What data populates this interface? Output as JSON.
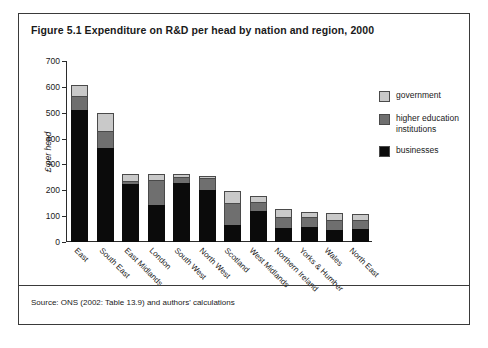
{
  "figure": {
    "title": "Figure 5.1 Expenditure on R&D per head by nation and region, 2000",
    "source": "Source: ONS (2002: Table 13.9) and authors' calculations"
  },
  "legend": {
    "position": "right",
    "items": [
      {
        "label": "government",
        "color": "#c9c9c9",
        "key": "government"
      },
      {
        "label": "higher education institutions",
        "color": "#6f6f6f",
        "key": "higher_education"
      },
      {
        "label": "businesses",
        "color": "#0b0b0b",
        "key": "businesses"
      }
    ]
  },
  "chart_data": {
    "type": "bar",
    "stacked": true,
    "title": "Figure 5.1 Expenditure on R&D per head by nation and region, 2000",
    "xlabel": "",
    "ylabel": "£ per head",
    "ylim": [
      0,
      700
    ],
    "ytick_step": 100,
    "yticks": [
      700,
      600,
      500,
      400,
      300,
      200,
      100,
      0
    ],
    "ytick_labels": [
      "700",
      "600",
      "500",
      "400",
      "300",
      "200",
      "100",
      "0"
    ],
    "grid": false,
    "categories": [
      "East",
      "South East",
      "East Midlands",
      "London",
      "South West",
      "North West",
      "Scotland",
      "West Midlands",
      "Northern Ireland",
      "Yorks & Humber",
      "Wales",
      "North East"
    ],
    "series": [
      {
        "name": "businesses",
        "color": "#0b0b0b",
        "values": [
          510,
          365,
          225,
          145,
          230,
          200,
          65,
          120,
          55,
          60,
          45,
          50
        ]
      },
      {
        "name": "higher education institutions",
        "color": "#6f6f6f",
        "values": [
          60,
          70,
          15,
          100,
          25,
          50,
          90,
          40,
          45,
          40,
          45,
          40
        ]
      },
      {
        "name": "government",
        "color": "#c9c9c9",
        "values": [
          45,
          70,
          30,
          25,
          15,
          15,
          50,
          25,
          35,
          25,
          30,
          25
        ]
      }
    ],
    "totals": [
      615,
      505,
      270,
      270,
      270,
      265,
      205,
      185,
      135,
      125,
      120,
      115
    ]
  }
}
